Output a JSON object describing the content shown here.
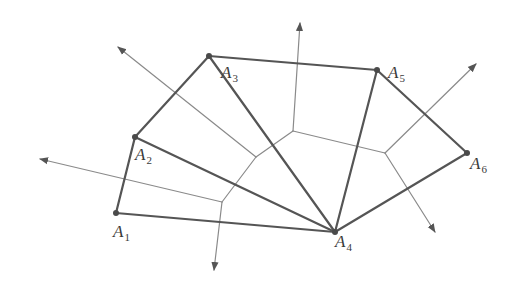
{
  "figure": {
    "type": "delaunay-voronoi-diagram",
    "colors": {
      "triangulation_edge": "#555555",
      "voronoi_edge": "#8a8a8a",
      "vertex_dot": "#4a4a4a",
      "label": "#3a3a3a",
      "background": "#ffffff"
    },
    "points": [
      {
        "id": "A1",
        "letter": "A",
        "index": "1",
        "x": 116,
        "y": 213,
        "label_x": 113,
        "label_y": 223
      },
      {
        "id": "A2",
        "letter": "A",
        "index": "2",
        "x": 135,
        "y": 137,
        "label_x": 135,
        "label_y": 146
      },
      {
        "id": "A3",
        "letter": "A",
        "index": "3",
        "x": 209,
        "y": 56,
        "label_x": 221,
        "label_y": 64
      },
      {
        "id": "A4",
        "letter": "A",
        "index": "4",
        "x": 335,
        "y": 232,
        "label_x": 335,
        "label_y": 233
      },
      {
        "id": "A5",
        "letter": "A",
        "index": "5",
        "x": 377,
        "y": 70,
        "label_x": 388,
        "label_y": 64
      },
      {
        "id": "A6",
        "letter": "A",
        "index": "6",
        "x": 467,
        "y": 153,
        "label_x": 470,
        "label_y": 155
      }
    ],
    "triangulation_edges": [
      [
        "A1",
        "A2"
      ],
      [
        "A2",
        "A3"
      ],
      [
        "A3",
        "A5"
      ],
      [
        "A5",
        "A6"
      ],
      [
        "A6",
        "A4"
      ],
      [
        "A4",
        "A1"
      ],
      [
        "A2",
        "A4"
      ],
      [
        "A3",
        "A4"
      ],
      [
        "A5",
        "A4"
      ]
    ],
    "voronoi_vertices": [
      {
        "id": "V1",
        "x": 222,
        "y": 202
      },
      {
        "id": "V2",
        "x": 256,
        "y": 157
      },
      {
        "id": "V3",
        "x": 293,
        "y": 131
      },
      {
        "id": "V4",
        "x": 385,
        "y": 153
      }
    ],
    "voronoi_edges": [
      [
        "V1",
        "V2"
      ],
      [
        "V2",
        "V3"
      ],
      [
        "V3",
        "V4"
      ]
    ],
    "voronoi_rays": [
      {
        "from": "V1",
        "to_x": 40,
        "to_y": 159
      },
      {
        "from": "V1",
        "to_x": 214,
        "to_y": 270
      },
      {
        "from": "V2",
        "to_x": 118,
        "to_y": 47
      },
      {
        "from": "V3",
        "to_x": 300,
        "to_y": 23
      },
      {
        "from": "V4",
        "to_x": 476,
        "to_y": 64
      },
      {
        "from": "V4",
        "to_x": 435,
        "to_y": 232
      }
    ]
  }
}
